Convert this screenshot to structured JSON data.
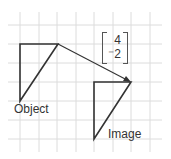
{
  "labels": {
    "object": "Object",
    "image": "Image"
  },
  "vector": {
    "x": "4",
    "y": "⁻2"
  },
  "colors": {
    "grid": "#dcdcdc",
    "shape": "#333333"
  }
}
